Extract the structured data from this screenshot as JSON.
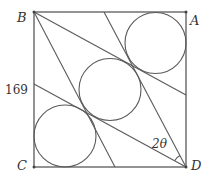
{
  "diagram": {
    "type": "geometry",
    "vertices": {
      "B": {
        "label": "B",
        "x": 34,
        "y": 12
      },
      "A": {
        "label": "A",
        "x": 186,
        "y": 12
      },
      "C": {
        "label": "C",
        "x": 34,
        "y": 167
      },
      "D": {
        "label": "D",
        "x": 186,
        "y": 167
      }
    },
    "side_label": "169",
    "angle_label": "2θ",
    "lines": [
      {
        "from": "B",
        "to": [
          186,
          95
        ]
      },
      {
        "from": "B",
        "to": [
          115,
          167
        ]
      },
      {
        "from": "D",
        "to": [
          104,
          12
        ]
      },
      {
        "from": "D",
        "to": [
          34,
          84
        ]
      }
    ],
    "circles": [
      {
        "name": "top-right",
        "cx": 155.5,
        "cy": 43,
        "r": 30.5
      },
      {
        "name": "middle",
        "cx": 110,
        "cy": 89.5,
        "r": 31
      },
      {
        "name": "bottom-left",
        "cx": 65,
        "cy": 136,
        "r": 31
      }
    ],
    "colors": {
      "stroke": "#5a5a5a",
      "text": "#333333"
    }
  }
}
